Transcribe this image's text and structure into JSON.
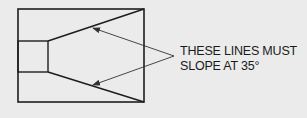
{
  "diagram": {
    "callout": {
      "line1": "THESE LINES MUST",
      "line2": "SLOPE AT 35°"
    },
    "colors": {
      "background": "#ebebeb",
      "stroke": "#1e1e1e",
      "leader": "#333333"
    }
  }
}
